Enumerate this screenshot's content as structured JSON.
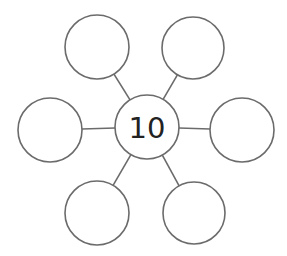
{
  "diagram": {
    "type": "number-bond-web",
    "center": {
      "label": "10",
      "cx": 147,
      "cy": 127,
      "r": 32
    },
    "outer_nodes": [
      {
        "id": "top-left",
        "label": "",
        "cx": 97,
        "cy": 47,
        "r": 32
      },
      {
        "id": "top-right",
        "label": "",
        "cx": 193,
        "cy": 48,
        "r": 31
      },
      {
        "id": "left",
        "label": "",
        "cx": 50,
        "cy": 130,
        "r": 32
      },
      {
        "id": "right",
        "label": "",
        "cx": 242,
        "cy": 130,
        "r": 32
      },
      {
        "id": "bottom-left",
        "label": "",
        "cx": 97,
        "cy": 213,
        "r": 32
      },
      {
        "id": "bottom-right",
        "label": "",
        "cx": 194,
        "cy": 213,
        "r": 31
      }
    ],
    "colors": {
      "stroke": "#6b6b6b",
      "text": "#222222",
      "background": "#ffffff"
    }
  }
}
